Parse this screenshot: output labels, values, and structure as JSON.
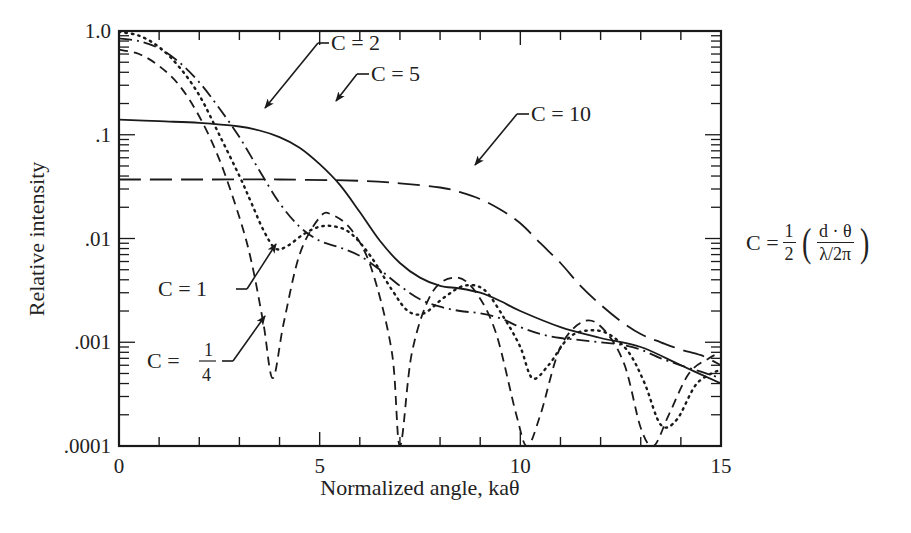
{
  "chart_data": {
    "type": "line",
    "title": "",
    "xlabel": "Normalized angle, kaθ",
    "ylabel": "Relative intensity",
    "xlim": [
      0,
      15
    ],
    "ylim": [
      0.0001,
      1.0
    ],
    "yscale": "log",
    "grid": false,
    "legend_position": "inline annotations with arrows",
    "x_ticks": [
      0,
      5,
      10,
      15
    ],
    "x_tick_labels": [
      "0",
      "5",
      "10",
      "15"
    ],
    "y_ticks": [
      1.0,
      0.1,
      0.01,
      0.001,
      0.0001
    ],
    "y_tick_labels": [
      "1.0",
      ".1",
      ".01",
      ".001",
      ".0001"
    ],
    "series": [
      {
        "name": "C = 1/4",
        "style": "short-dash",
        "x": [
          0,
          0.5,
          1,
          1.5,
          2,
          2.5,
          3,
          3.3,
          3.6,
          3.83,
          4.1,
          4.5,
          5,
          5.3,
          5.8,
          6.3,
          6.8,
          7.0,
          7.3,
          7.8,
          8.4,
          8.9,
          9.4,
          9.9,
          10.17,
          10.5,
          11,
          11.6,
          12.1,
          12.6,
          13.0,
          13.32,
          13.7,
          14.2,
          14.7,
          15
        ],
        "y": [
          0.66,
          0.6,
          0.46,
          0.3,
          0.15,
          0.058,
          0.016,
          0.006,
          0.0015,
          0.00045,
          0.0015,
          0.007,
          0.016,
          0.017,
          0.012,
          0.005,
          0.0008,
          0.0001,
          0.0008,
          0.003,
          0.0042,
          0.003,
          0.0012,
          0.0002,
          0.0001,
          0.0002,
          0.0009,
          0.0016,
          0.0013,
          0.0006,
          0.00015,
          0.0001,
          0.0002,
          0.0005,
          0.0007,
          0.0008
        ]
      },
      {
        "name": "C = 1",
        "style": "dotted",
        "x": [
          0,
          0.5,
          1,
          1.5,
          2,
          2.5,
          3,
          3.3,
          3.6,
          3.9,
          4.2,
          4.6,
          5,
          5.4,
          5.8,
          6.3,
          6.8,
          7.2,
          7.6,
          8.1,
          8.6,
          9.1,
          9.6,
          10.0,
          10.3,
          10.7,
          11.2,
          11.7,
          12.2,
          12.7,
          13.1,
          13.5,
          13.9,
          14.4,
          15
        ],
        "y": [
          0.98,
          0.9,
          0.7,
          0.45,
          0.24,
          0.1,
          0.04,
          0.022,
          0.012,
          0.008,
          0.0085,
          0.011,
          0.013,
          0.013,
          0.011,
          0.0065,
          0.0032,
          0.002,
          0.0019,
          0.0027,
          0.0035,
          0.0032,
          0.0017,
          0.0009,
          0.00045,
          0.0006,
          0.0011,
          0.0013,
          0.0012,
          0.0008,
          0.0004,
          0.00016,
          0.00018,
          0.0004,
          0.00055
        ]
      },
      {
        "name": "C = 2",
        "style": "dash-dot",
        "x": [
          0,
          0.5,
          1,
          1.5,
          2,
          2.5,
          3,
          3.5,
          4,
          4.5,
          5,
          5.5,
          6,
          6.5,
          7,
          7.5,
          8,
          8.5,
          9,
          9.5,
          10,
          10.5,
          11,
          11.5,
          12,
          12.5,
          13,
          13.5,
          14,
          14.5,
          15
        ],
        "y": [
          0.85,
          0.8,
          0.68,
          0.5,
          0.32,
          0.18,
          0.095,
          0.045,
          0.022,
          0.013,
          0.0095,
          0.0082,
          0.0068,
          0.005,
          0.0035,
          0.0026,
          0.0022,
          0.002,
          0.0019,
          0.0017,
          0.0014,
          0.0012,
          0.0011,
          0.00105,
          0.001,
          0.00095,
          0.00085,
          0.0007,
          0.0006,
          0.00052,
          0.00045
        ]
      },
      {
        "name": "C = 5",
        "style": "solid",
        "x": [
          0,
          1,
          2,
          3,
          3.5,
          4,
          4.5,
          5,
          5.5,
          6,
          6.5,
          7,
          7.5,
          8,
          8.5,
          9,
          9.5,
          10,
          11,
          12,
          13,
          14,
          15
        ],
        "y": [
          0.14,
          0.135,
          0.13,
          0.12,
          0.11,
          0.095,
          0.075,
          0.052,
          0.033,
          0.018,
          0.0095,
          0.0058,
          0.0042,
          0.0035,
          0.0033,
          0.003,
          0.0025,
          0.002,
          0.0014,
          0.0011,
          0.0009,
          0.0006,
          0.0004
        ]
      },
      {
        "name": "C = 10",
        "style": "long-dash",
        "x": [
          0,
          2,
          4,
          6,
          7,
          8,
          8.5,
          9,
          9.5,
          10,
          10.5,
          11,
          11.5,
          12,
          12.5,
          13,
          13.5,
          14,
          14.5,
          15
        ],
        "y": [
          0.037,
          0.037,
          0.037,
          0.036,
          0.034,
          0.031,
          0.028,
          0.024,
          0.019,
          0.014,
          0.009,
          0.0058,
          0.0035,
          0.0023,
          0.0016,
          0.0012,
          0.001,
          0.00085,
          0.00075,
          0.0006
        ]
      }
    ],
    "annotations": [
      {
        "text": "C = 2",
        "text_x": 285,
        "text_y": 50,
        "arrow_from": [
          329,
          43
        ],
        "line_end": [
          318,
          43
        ],
        "arrow_to": [
          265,
          108
        ]
      },
      {
        "text": "C = 5",
        "text_x": 323,
        "text_y": 81,
        "arrow_from": [
          369,
          74
        ],
        "line_end": [
          357,
          74
        ],
        "arrow_to": [
          336,
          101
        ]
      },
      {
        "text": "C = 10",
        "text_x": 528,
        "text_y": 121,
        "arrow_from": [
          529,
          114
        ],
        "line_end": [
          517,
          114
        ],
        "arrow_to": [
          475,
          165
        ]
      },
      {
        "text": "C = 1",
        "text_x": 158,
        "text_y": 295,
        "arrow_from": [
          236,
          289
        ],
        "line_end": [
          247,
          289
        ],
        "arrow_to": [
          276,
          244
        ]
      },
      {
        "text": "C = 1/4",
        "text_x": 147,
        "text_y": 366,
        "arrow_from": [
          222,
          361
        ],
        "line_end": [
          233,
          361
        ],
        "arrow_to": [
          265,
          316
        ]
      }
    ],
    "side_formula": "C = 1/2 (d·θ / λ/2π)"
  },
  "labels": {
    "annotation_c2": "C = 2",
    "annotation_c5": "C = 5",
    "annotation_c10": "C = 10",
    "annotation_c1": "C = 1",
    "annotation_quarter_prefix": "C =",
    "annotation_quarter_num": "1",
    "annotation_quarter_den": "4"
  },
  "formula": {
    "lhs": "C =",
    "half_num": "1",
    "half_den": "2",
    "left_paren": "(",
    "right_paren": ")",
    "inner_num": "d · θ",
    "inner_den": "λ/2π"
  }
}
